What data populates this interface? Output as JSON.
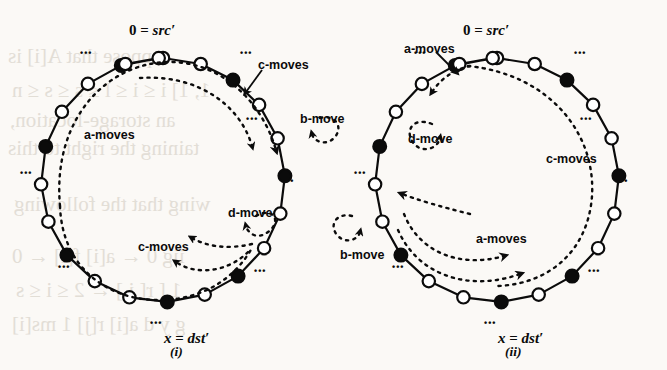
{
  "figure": {
    "kind": "two-panel ring diagram",
    "background": "#fbf9f6",
    "ink": "#0b0b0b",
    "bleed_text": [
      {
        "text": "ppose that A[i] is",
        "x": 8,
        "y": 44
      },
      {
        "text": "1, 1] i ≤ i ≤ l ≤ s ≤ s ≤ n",
        "x": 12,
        "y": 78
      },
      {
        "text": "an storage-location,",
        "x": 10,
        "y": 108
      },
      {
        "text": "taining the right to this",
        "x": 8,
        "y": 136
      },
      {
        "text": "wing that the following",
        "x": 14,
        "y": 192
      },
      {
        "text": "iig 0 ← a[i] f[i] ← 0",
        "x": 12,
        "y": 244
      },
      {
        "text": "1 [ r[ i ] ← 2 ≤ i ≤ s",
        "x": 16,
        "y": 278
      },
      {
        "text": "g y d a[i] r[j] 1 ms[i]",
        "x": 12,
        "y": 312
      }
    ]
  },
  "panels": [
    {
      "id": "i",
      "caption": "(i)",
      "caption_pos": {
        "x": 170,
        "y": 344
      },
      "center": {
        "x": 163,
        "y": 180
      },
      "radius": 122,
      "src_label": {
        "text_plain": "0 = src′",
        "num": "0",
        "eq": " = ",
        "name": "src′",
        "x": 163,
        "y": 22
      },
      "dst_label": {
        "text_plain": "x = dst′",
        "var": "x",
        "eq": " = ",
        "name": "dst′",
        "x": 200,
        "y": 330
      },
      "nodes": [
        {
          "angle": -90,
          "filled": false
        },
        {
          "angle": -72,
          "filled": false
        },
        {
          "angle": -55,
          "filled": true
        },
        {
          "angle": -38,
          "filled": false
        },
        {
          "angle": -20,
          "filled": false
        },
        {
          "angle": -2,
          "filled": true
        },
        {
          "angle": 16,
          "filled": false
        },
        {
          "angle": 34,
          "filled": false
        },
        {
          "angle": 52,
          "filled": true
        },
        {
          "angle": 70,
          "filled": false
        },
        {
          "angle": 88,
          "filled": true
        },
        {
          "angle": 106,
          "filled": false
        },
        {
          "angle": 124,
          "filled": false
        },
        {
          "angle": 142,
          "filled": true
        },
        {
          "angle": 160,
          "filled": false
        },
        {
          "angle": 178,
          "filled": false
        },
        {
          "angle": 196,
          "filled": true
        },
        {
          "angle": 214,
          "filled": false
        },
        {
          "angle": 232,
          "filled": false
        },
        {
          "angle": 250,
          "filled": true
        },
        {
          "angle": 268,
          "filled": false
        },
        {
          "angle": -108,
          "filled": false
        }
      ],
      "ellipses": [
        {
          "x": 80,
          "y": 48,
          "rot": 0
        },
        {
          "x": 240,
          "y": 48,
          "rot": 0
        },
        {
          "x": 20,
          "y": 168,
          "rot": 0
        },
        {
          "x": 246,
          "y": 114,
          "rot": 0
        },
        {
          "x": 282,
          "y": 176,
          "rot": 0
        },
        {
          "x": 58,
          "y": 262,
          "rot": 0
        },
        {
          "x": 254,
          "y": 266,
          "rot": 0
        },
        {
          "x": 150,
          "y": 318,
          "rot": 0
        }
      ],
      "move_labels": [
        {
          "name": "a-moves",
          "text": "a-moves",
          "x": 84,
          "y": 128
        },
        {
          "name": "c-moves-upper",
          "text": "c-moves",
          "x": 258,
          "y": 58
        },
        {
          "name": "b-move",
          "text": "b-move",
          "x": 300,
          "y": 112
        },
        {
          "name": "d-move",
          "text": "d-move",
          "x": 228,
          "y": 206
        },
        {
          "name": "c-moves-lower",
          "text": "c-moves",
          "x": 138,
          "y": 240
        }
      ]
    },
    {
      "id": "ii",
      "caption": "(ii)",
      "caption_pos": {
        "x": 505,
        "y": 344
      },
      "center": {
        "x": 497,
        "y": 180
      },
      "radius": 122,
      "src_label": {
        "text_plain": "0 = src′",
        "num": "0",
        "eq": " = ",
        "name": "src′",
        "x": 497,
        "y": 22
      },
      "dst_label": {
        "text_plain": "x = dst′",
        "var": "x",
        "eq": " = ",
        "name": "dst′",
        "x": 534,
        "y": 330
      },
      "nodes": [
        {
          "angle": -90,
          "filled": false
        },
        {
          "angle": -72,
          "filled": false
        },
        {
          "angle": -55,
          "filled": true
        },
        {
          "angle": -38,
          "filled": false
        },
        {
          "angle": -20,
          "filled": false
        },
        {
          "angle": -2,
          "filled": true
        },
        {
          "angle": 16,
          "filled": false
        },
        {
          "angle": 34,
          "filled": false
        },
        {
          "angle": 52,
          "filled": true
        },
        {
          "angle": 70,
          "filled": false
        },
        {
          "angle": 88,
          "filled": true
        },
        {
          "angle": 106,
          "filled": false
        },
        {
          "angle": 124,
          "filled": false
        },
        {
          "angle": 142,
          "filled": true
        },
        {
          "angle": 160,
          "filled": false
        },
        {
          "angle": 178,
          "filled": false
        },
        {
          "angle": 196,
          "filled": true
        },
        {
          "angle": 214,
          "filled": false
        },
        {
          "angle": 232,
          "filled": false
        },
        {
          "angle": 250,
          "filled": true
        },
        {
          "angle": 268,
          "filled": false
        },
        {
          "angle": -108,
          "filled": false
        }
      ],
      "ellipses": [
        {
          "x": 414,
          "y": 48,
          "rot": 0
        },
        {
          "x": 574,
          "y": 48,
          "rot": 0
        },
        {
          "x": 354,
          "y": 168,
          "rot": 0
        },
        {
          "x": 580,
          "y": 114,
          "rot": 0
        },
        {
          "x": 616,
          "y": 176,
          "rot": 0
        },
        {
          "x": 392,
          "y": 262,
          "rot": 0
        },
        {
          "x": 588,
          "y": 266,
          "rot": 0
        },
        {
          "x": 484,
          "y": 318,
          "rot": 0
        }
      ],
      "move_labels": [
        {
          "name": "a-moves-top",
          "text": "a-moves",
          "x": 404,
          "y": 42
        },
        {
          "name": "d-move",
          "text": "d-move",
          "x": 408,
          "y": 132
        },
        {
          "name": "c-moves",
          "text": "c-moves",
          "x": 546,
          "y": 152
        },
        {
          "name": "a-moves-inner",
          "text": "a-moves",
          "x": 476,
          "y": 232
        },
        {
          "name": "b-move",
          "text": "b-move",
          "x": 340,
          "y": 248
        }
      ]
    }
  ]
}
